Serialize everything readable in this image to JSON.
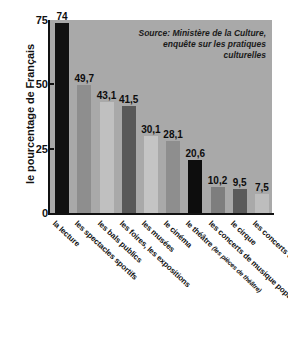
{
  "chart_data": {
    "type": "bar",
    "title": "",
    "xlabel": "",
    "ylabel": "le pourcentage de Français",
    "ylim": [
      0,
      75
    ],
    "yticks": [
      0,
      25,
      50,
      75
    ],
    "ytick_labels": [
      "0",
      "25",
      "50",
      "75"
    ],
    "grid": false,
    "legend": "none",
    "source_note": "Source: Ministère de la Culture, enquête sur les pratiques culturelles",
    "source_line1": "Source: Ministère de la Culture,",
    "source_line2": "enquête sur les pratiques culturelles",
    "plot_background": "#a9a9a9",
    "categories": [
      "la lecture",
      "les spectacles sportifs",
      "les bals publics",
      "les foires, les expositions",
      "les musées",
      "le cinéma",
      "le théâtre (les pièces de théâtre)",
      "les concerts de musique populaire",
      "le cirque",
      "les concerts de musique classique"
    ],
    "values": [
      74,
      49.7,
      43.1,
      41.5,
      30.1,
      28.1,
      20.6,
      10.2,
      9.5,
      7.5
    ],
    "value_labels": [
      "74",
      "49,7",
      "43,1",
      "41,5",
      "30,1",
      "28,1",
      "20,6",
      "10,2",
      "9,5",
      "7,5"
    ],
    "bar_colors": [
      "#111111",
      "#8e8e8e",
      "#c0c0c0",
      "#585858",
      "#c4c4c4",
      "#8e8e8e",
      "#0d0d0d",
      "#7e7e7e",
      "#5a5a5a",
      "#bdbdbd"
    ],
    "bars": [
      {
        "label": "la lecture",
        "label_main": "la lecture",
        "label_sub": "",
        "value": 74,
        "value_label": "74",
        "color": "#111111"
      },
      {
        "label": "les spectacles sportifs",
        "label_main": "les spectacles sportifs",
        "label_sub": "",
        "value": 49.7,
        "value_label": "49,7",
        "color": "#8e8e8e"
      },
      {
        "label": "les bals publics",
        "label_main": "les bals publics",
        "label_sub": "",
        "value": 43.1,
        "value_label": "43,1",
        "color": "#c0c0c0"
      },
      {
        "label": "les foires, les expositions",
        "label_main": "les foires, les expositions",
        "label_sub": "",
        "value": 41.5,
        "value_label": "41,5",
        "color": "#585858"
      },
      {
        "label": "les musées",
        "label_main": "les musées",
        "label_sub": "",
        "value": 30.1,
        "value_label": "30,1",
        "color": "#c4c4c4"
      },
      {
        "label": "le cinéma",
        "label_main": "le cinéma",
        "label_sub": "",
        "value": 28.1,
        "value_label": "28,1",
        "color": "#8e8e8e"
      },
      {
        "label": "le théâtre (les pièces de théâtre)",
        "label_main": "le théâtre ",
        "label_sub": "(les pièces de théâtre)",
        "value": 20.6,
        "value_label": "20,6",
        "color": "#0d0d0d"
      },
      {
        "label": "les concerts de musique populaire",
        "label_main": "les concerts de musique populaire",
        "label_sub": "",
        "value": 10.2,
        "value_label": "10,2",
        "color": "#7e7e7e"
      },
      {
        "label": "le cirque",
        "label_main": "le cirque",
        "label_sub": "",
        "value": 9.5,
        "value_label": "9,5",
        "color": "#5a5a5a"
      },
      {
        "label": "les concerts de musique classique",
        "label_main": "les concerts de musique classique",
        "label_sub": "",
        "value": 7.5,
        "value_label": "7,5",
        "color": "#bdbdbd"
      }
    ]
  }
}
